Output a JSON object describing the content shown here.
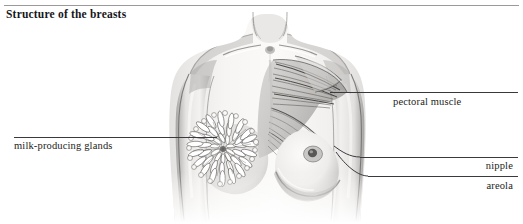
{
  "page": {
    "title": "Structure of the breasts",
    "background_color": "#ffffff",
    "rule_color": "#9a9a9a",
    "text_color": "#1d1d20",
    "leader_color": "#3a3a3e"
  },
  "illustration": {
    "name": "female-torso-anatomy",
    "description": "Grayscale pencil rendering of a female upper torso, front view. Left breast is cut away to reveal radiating milk-producing glands; right breast shows the fan-shaped pectoral muscle fibers converging toward the armpit.",
    "style": "graphite pencil medical illustration",
    "ink_color": "#5d5d63",
    "shade_color": "#b9b9bd",
    "highlight_color": "#f2f0ee"
  },
  "labels": [
    {
      "id": "milk-producing-glands",
      "text": "milk-producing glands",
      "side": "left",
      "target": "radiating gland lobules of the left breast"
    },
    {
      "id": "pectoral-muscle",
      "text": "pectoral muscle",
      "side": "right",
      "target": "fan of pectoral muscle fibers at the shoulder"
    },
    {
      "id": "nipple",
      "text": "nipple",
      "side": "right",
      "target": "nipple of the right breast"
    },
    {
      "id": "areola",
      "text": "areola",
      "side": "right",
      "target": "areola surrounding the right nipple"
    }
  ]
}
